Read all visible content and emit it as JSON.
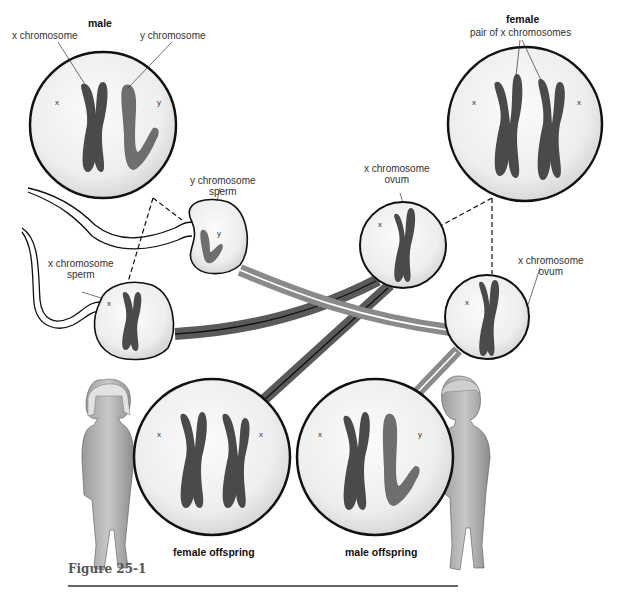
{
  "figure": {
    "caption": "Figure 25-1"
  },
  "parents": {
    "male": {
      "label": "male",
      "callout_left": "x chromosome",
      "callout_right": "y chromosome",
      "inner_left": "x",
      "inner_right": "y"
    },
    "female": {
      "label": "female",
      "callout": "pair of x chromosomes",
      "inner_left": "x",
      "inner_right": "x"
    }
  },
  "gametes": {
    "y_sperm": {
      "label_line1": "y chromosome",
      "label_line2": "sperm",
      "inner": "y"
    },
    "x_sperm": {
      "label_line1": "x chromosome",
      "label_line2": "sperm",
      "inner": "x"
    },
    "ovum_1": {
      "label_line1": "x chromosome",
      "label_line2": "ovum",
      "inner": "x"
    },
    "ovum_2": {
      "label_line1": "x chromosome",
      "label_line2": "ovum",
      "inner": "x"
    }
  },
  "offspring": {
    "female": {
      "label": "female offspring",
      "inner_left": "x",
      "inner_right": "x"
    },
    "male": {
      "label": "male offspring",
      "inner_left": "x",
      "inner_right": "y"
    }
  },
  "colors": {
    "x_chromosome": "#4a4a4a",
    "y_chromosome": "#6e6e6e",
    "cell_fill": "#f1f1f1",
    "outline": "#111111",
    "x_path_arrow": "#5a5a5a",
    "y_path_arrow": "#8a8a8a"
  }
}
